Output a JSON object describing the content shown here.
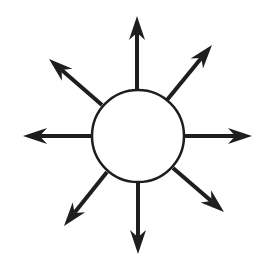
{
  "diagram": {
    "type": "radiating-arrows",
    "title": "",
    "colors": {
      "background": "#ffffff",
      "stroke": "#1e1e1e",
      "circle_fill": "#ffffff"
    },
    "center_circle": {
      "cx": 138,
      "cy": 136,
      "r": 46,
      "stroke_width": 2.5
    },
    "arrows": [
      {
        "direction": "north",
        "from": [
          137,
          90
        ],
        "to": [
          137,
          16
        ]
      },
      {
        "direction": "north-east",
        "from": [
          167,
          100
        ],
        "to": [
          212,
          45
        ]
      },
      {
        "direction": "east",
        "from": [
          184,
          136
        ],
        "to": [
          252,
          136
        ]
      },
      {
        "direction": "south-east",
        "from": [
          173,
          168
        ],
        "to": [
          224,
          212
        ]
      },
      {
        "direction": "south",
        "from": [
          138,
          182
        ],
        "to": [
          138,
          254
        ]
      },
      {
        "direction": "south-west",
        "from": [
          107,
          172
        ],
        "to": [
          64,
          226
        ]
      },
      {
        "direction": "west",
        "from": [
          92,
          136
        ],
        "to": [
          23,
          136
        ]
      },
      {
        "direction": "north-west",
        "from": [
          102,
          105
        ],
        "to": [
          49,
          59
        ]
      }
    ],
    "arrow_count": 8,
    "shaft_width": 4,
    "head_length": 24,
    "head_half_width": 8
  }
}
